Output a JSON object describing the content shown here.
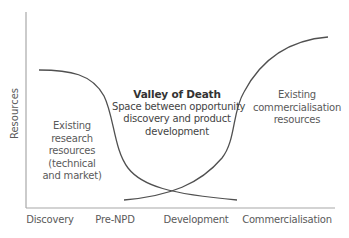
{
  "diagram": {
    "type": "valley-of-death",
    "y_axis": {
      "label": "Resources"
    },
    "x_axis": {
      "ticks": [
        {
          "label": "Discovery",
          "x": 50
        },
        {
          "label": "Pre-NPD",
          "x": 115
        },
        {
          "label": "Development",
          "x": 196
        },
        {
          "label": "Commercialisation",
          "x": 287
        }
      ]
    },
    "annotations": {
      "research": {
        "lines": [
          "Existing",
          "research",
          "resources",
          "(technical",
          "and market)"
        ]
      },
      "valley": {
        "title": "Valley of Death",
        "lines": [
          "Space between opportunity",
          "discovery and product",
          "development"
        ]
      },
      "commercial": {
        "lines": [
          "Existing",
          "commercialisation",
          "resources"
        ]
      }
    },
    "curves": [
      {
        "name": "research-resources",
        "trend": "declining",
        "description": "High at Discovery, drops sharply through Pre-NPD, low at Development"
      },
      {
        "name": "commercialisation-resources",
        "trend": "rising",
        "description": "Low at Pre-NPD, rises sharply through Development, high at Commercialisation"
      }
    ],
    "colors": {
      "axis": "#a8a8a8",
      "curve": "#505050",
      "text": "#5a5a5a",
      "title": "#333333"
    }
  }
}
